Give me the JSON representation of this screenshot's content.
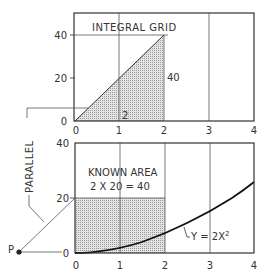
{
  "top_chart": {
    "title": "INTEGRAL GRID",
    "x_ticks": [
      "0",
      "1",
      "2",
      "3",
      "4"
    ],
    "y_ticks": [
      "0",
      "20",
      "40"
    ],
    "label_height": "40",
    "label_base": "2"
  },
  "bottom_chart": {
    "annotation_line1": "KNOWN AREA",
    "annotation_line2": "2 X 20 = 40",
    "curve_label": "Y = 2X",
    "curve_exp": "2",
    "x_ticks": [
      "0",
      "1",
      "2",
      "3",
      "4"
    ],
    "y_ticks": [
      "0",
      "20",
      "40"
    ]
  },
  "side": {
    "parallel_label": "PARALLEL",
    "point_label": "P"
  },
  "colors": {
    "line": "#333333",
    "grid": "#555555",
    "shade": "#c8c8c8"
  }
}
